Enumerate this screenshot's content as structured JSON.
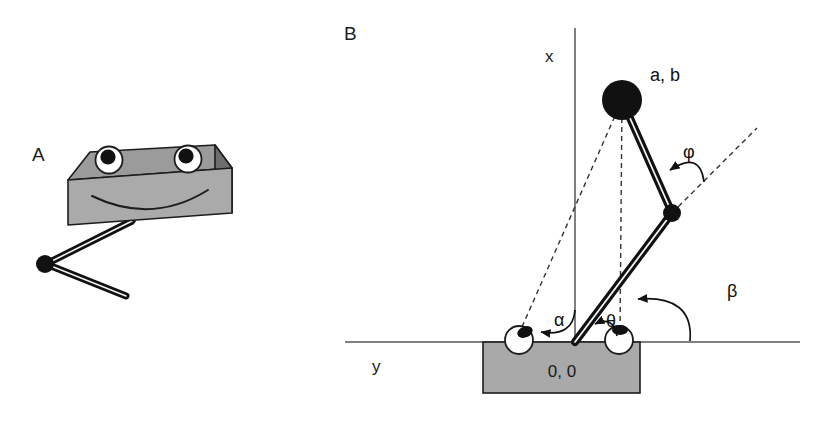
{
  "figure": {
    "background_color": "#ffffff",
    "ink_color": "#1c1c1c",
    "panels": [
      {
        "id": "A",
        "label": "A",
        "label_x": 32,
        "label_y": 161,
        "description": "robot body block with two eyes and a smile plus a two-segment arm"
      },
      {
        "id": "B",
        "label": "B",
        "label_x": 344,
        "label_y": 40,
        "description": "kinematic schematic with x and y axes, base block, two eyes, two-link arm and labelled angles"
      }
    ]
  },
  "panel_a": {
    "panel_letter": "A",
    "body": {
      "name": "robot-body-block",
      "front_face_color": "#a9a9a9",
      "top_face_color": "#9a9a9a",
      "side_face_color": "#707070",
      "outline_color": "#1c1c1c"
    },
    "eyes": [
      {
        "name": "left-eye",
        "cx": 109,
        "cy": 160,
        "r": 13,
        "pupil_cx": 108,
        "pupil_cy": 157,
        "pupil_r": 7.5
      },
      {
        "name": "right-eye",
        "cx": 188,
        "cy": 159,
        "r": 13,
        "pupil_cx": 186,
        "pupil_cy": 156,
        "pupil_r": 7.5
      }
    ],
    "mouth": {
      "name": "smile",
      "description": "downward curved arc on the front face"
    },
    "arm": {
      "name": "robot-arm",
      "shoulder": {
        "x": 132,
        "y": 221
      },
      "elbow": {
        "x": 45,
        "y": 264
      },
      "tip": {
        "x": 126,
        "y": 296
      },
      "joint_radius": 9,
      "link_color": "#111111"
    }
  },
  "panel_b": {
    "panel_letter": "B",
    "axes": {
      "x_axis": {
        "name": "x-axis",
        "label": "x",
        "label_x": 545,
        "label_y": 62,
        "orientation": "vertical",
        "x": 575,
        "y_top": 28,
        "y_bottom": 342
      },
      "y_axis": {
        "name": "y-axis",
        "label": "y",
        "label_x": 372,
        "label_y": 372,
        "orientation": "horizontal",
        "y": 342,
        "x_left": 345,
        "x_right": 800
      }
    },
    "origin": {
      "name": "origin",
      "label": "0, 0",
      "x": 575,
      "y": 342,
      "label_x": 562,
      "label_y": 376
    },
    "base_block": {
      "name": "base-block",
      "x": 483,
      "y": 342,
      "width": 157,
      "height": 51,
      "fill_color": "#a9a9a9",
      "stroke_color": "#1c1c1c"
    },
    "eyes": [
      {
        "name": "left-eye",
        "cx": 519,
        "cy": 340,
        "r": 14,
        "pupil_cx": 525,
        "pupil_cy": 332,
        "pupil_rx": 8,
        "pupil_ry": 5.5,
        "pupil_rotation": -22
      },
      {
        "name": "right-eye",
        "cx": 619,
        "cy": 340,
        "r": 14,
        "pupil_cx": 620,
        "pupil_cy": 330,
        "pupil_rx": 8,
        "pupil_ry": 5,
        "pupil_rotation": 0
      }
    ],
    "arm": {
      "name": "two-link-arm",
      "base_joint": {
        "name": "base-joint",
        "x": 575,
        "y": 342
      },
      "elbow_joint": {
        "name": "elbow-joint",
        "x": 672,
        "y": 213,
        "r": 9
      },
      "end_effector": {
        "name": "end-effector",
        "x": 622,
        "y": 100,
        "r": 20,
        "label": "a, b",
        "label_x": 650,
        "label_y": 80
      },
      "link_color": "#111111"
    },
    "sight_lines": [
      {
        "name": "left-eye-sight-line",
        "from_x": 622,
        "from_y": 100,
        "to_x": 518,
        "to_y": 335
      },
      {
        "name": "right-eye-sight-line",
        "from_x": 622,
        "from_y": 100,
        "to_x": 620,
        "to_y": 334
      },
      {
        "name": "elbow-extension-line",
        "from_x": 672,
        "from_y": 213,
        "to_x": 757,
        "to_y": 128
      }
    ],
    "angles": [
      {
        "name": "angle-alpha",
        "symbol": "α",
        "label_x": 554,
        "label_y": 325,
        "description": "angle at left eye between vertical x-axis and sight line to the end effector"
      },
      {
        "name": "angle-theta",
        "symbol": "θ",
        "label_x": 608,
        "label_y": 327,
        "description": "angle at the origin between the lower arm link and the right eye sight line"
      },
      {
        "name": "angle-beta",
        "symbol": "β",
        "label_x": 731,
        "label_y": 296,
        "description": "angle at the right eye between the ground line and the sight line to the end effector"
      },
      {
        "name": "angle-phi",
        "symbol": "φ",
        "label_x": 687,
        "label_y": 157,
        "description": "angle at the elbow between the upper arm link and the dashed extension of the lower link"
      }
    ]
  }
}
